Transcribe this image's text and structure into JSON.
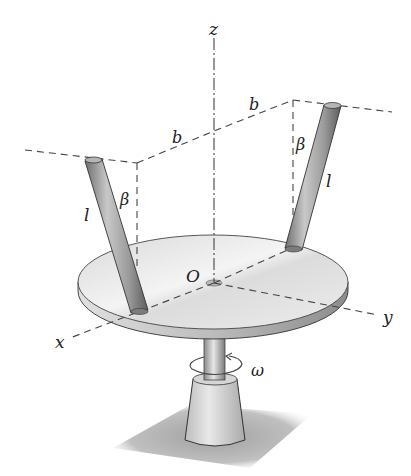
{
  "figure": {
    "type": "mechanics-diagram",
    "labels": {
      "z_axis": "z",
      "x_axis": "x",
      "y_axis": "y",
      "origin": "O",
      "dimension_b_left": "b",
      "dimension_b_right": "b",
      "angle_left": "β",
      "angle_right": "β",
      "length_left": "l",
      "length_right": "l",
      "angular_velocity": "ω"
    },
    "colors": {
      "line": "#444444",
      "disk_top": "#e4e4e4",
      "disk_edge": "#bdbdbd",
      "rod": "#9a9a9a",
      "shadow": "#9e9e9e",
      "background": "#ffffff"
    }
  }
}
